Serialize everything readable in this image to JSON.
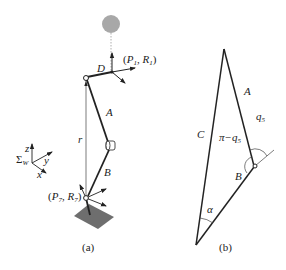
{
  "figure_a": {
    "caption": "(a)",
    "labels": {
      "D": "D",
      "P1R1_open": "(",
      "P1": "P",
      "P1_sub": "1",
      "R1": "R",
      "R1_sub": "1",
      "A": "A",
      "r": "r",
      "B": "B",
      "P7": "P",
      "P7_sub": "7",
      "R7": "R",
      "R7_sub": "7",
      "frame_sigma": "Σ",
      "frame_sub": "W",
      "axis_z": "z",
      "axis_y": "y",
      "axis_x": "x",
      "sep": ", ",
      "close": ")"
    }
  },
  "figure_b": {
    "caption": "(b)",
    "labels": {
      "A": "A",
      "B": "B",
      "C": "C",
      "q5": "q",
      "q5_sub": "5",
      "pi_minus_q5": "π−q",
      "pi_minus_q5_sub": "5",
      "alpha": "α"
    }
  },
  "colors": {
    "line": "#222222",
    "head": "#a8a8a8",
    "plate": "#6e6e6e"
  }
}
